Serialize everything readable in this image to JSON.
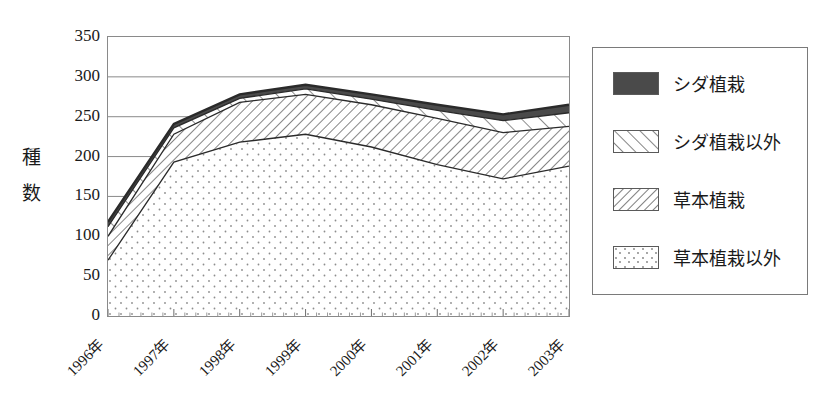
{
  "figure": {
    "title_faint": "",
    "y_axis_title_chars": [
      "種",
      "数"
    ]
  },
  "chart_data": {
    "type": "area",
    "stacked": true,
    "title": "",
    "xlabel": "",
    "ylabel": "種数",
    "categories": [
      "1996年",
      "1997年",
      "1998年",
      "1999年",
      "2000年",
      "2001年",
      "2002年",
      "2003年"
    ],
    "yticks": [
      0,
      50,
      100,
      150,
      200,
      250,
      300,
      350
    ],
    "ylim": [
      0,
      350
    ],
    "grid": true,
    "legend_position": "right",
    "series": [
      {
        "name": "草本植栽以外",
        "pattern": "dotted",
        "values": [
          70,
          193,
          218,
          228,
          212,
          190,
          172,
          188
        ]
      },
      {
        "name": "草本植栽",
        "pattern": "diagonal-dense",
        "values": [
          30,
          35,
          50,
          50,
          53,
          58,
          58,
          50
        ]
      },
      {
        "name": "シダ植栽以外",
        "pattern": "diagonal-sparse",
        "values": [
          12,
          8,
          5,
          7,
          7,
          10,
          15,
          17
        ]
      },
      {
        "name": "シダ植栽",
        "pattern": "solid-dark",
        "values": [
          6,
          5,
          5,
          5,
          6,
          7,
          8,
          10
        ]
      }
    ],
    "cumulative_tops": {
      "草本植栽以外": [
        70,
        193,
        218,
        228,
        212,
        190,
        172,
        188
      ],
      "草本植栽": [
        100,
        228,
        268,
        278,
        265,
        248,
        230,
        238
      ],
      "シダ植栽以外": [
        112,
        236,
        273,
        285,
        272,
        258,
        245,
        255
      ],
      "シダ植栽": [
        118,
        241,
        278,
        290,
        278,
        265,
        253,
        265
      ]
    }
  },
  "legend": {
    "items": [
      {
        "label": "シダ植栽",
        "pattern": "solid-dark"
      },
      {
        "label": "シダ植栽以外",
        "pattern": "diagonal-sparse"
      },
      {
        "label": "草本植栽",
        "pattern": "diagonal-dense"
      },
      {
        "label": "草本植栽以外",
        "pattern": "dotted"
      }
    ]
  },
  "colors": {
    "solid_dark": "#4a4a4a",
    "line": "#2a2a2a",
    "frame": "#8a8a8a",
    "grid": "#8a8a8a",
    "text": "#1a1a1a",
    "background": "#ffffff"
  }
}
